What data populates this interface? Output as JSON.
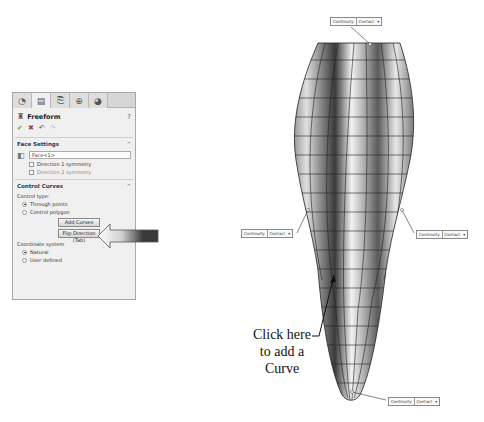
{
  "panel": {
    "tabs": [
      {
        "name": "feature-manager",
        "glyph": "◔"
      },
      {
        "name": "property-manager",
        "glyph": "▤"
      },
      {
        "name": "configuration-manager",
        "glyph": "⎘"
      },
      {
        "name": "dimxpert-manager",
        "glyph": "⊕"
      },
      {
        "name": "display-manager",
        "glyph": "◕"
      }
    ],
    "title": "Freeform",
    "help_glyph": "?",
    "actions": {
      "ok": "✔",
      "cancel": "✖",
      "undo": "↶",
      "redo": "↷"
    },
    "face_settings": {
      "header": "Face Settings",
      "caret": "^",
      "face_value": "Face<1>",
      "direction1_label": "Direction 1 symmetry",
      "direction2_label": "Direction 2 symmetry"
    },
    "control_curves": {
      "header": "Control Curves",
      "caret": "^",
      "control_type_label": "Control type:",
      "options": [
        {
          "label": "Through points",
          "selected": true
        },
        {
          "label": "Control polygon",
          "selected": false
        }
      ],
      "add_curves_button": "Add Curves",
      "flip_direction_button": "Flip Direction (Tab)",
      "coordinate_system_label": "Coordinate system",
      "coordinate_options": [
        {
          "label": "Natural",
          "selected": true
        },
        {
          "label": "User defined",
          "selected": false
        }
      ]
    }
  },
  "continuity_boxes": [
    {
      "position": "top",
      "label": "Continuity",
      "value": "Contact",
      "dropdown": "▾"
    },
    {
      "position": "left",
      "label": "Continuity",
      "value": "Contact",
      "dropdown": "▾"
    },
    {
      "position": "right",
      "label": "Continuity",
      "value": "Contact",
      "dropdown": "▾"
    },
    {
      "position": "bottom",
      "label": "Continuity",
      "value": "Contact",
      "dropdown": "▾"
    }
  ],
  "annotation": {
    "text_line1": "Click here",
    "text_line2": "to add a",
    "text_line3": "Curve"
  }
}
